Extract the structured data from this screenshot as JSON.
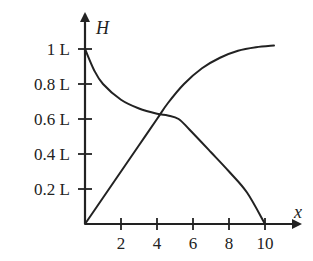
{
  "chart_data": {
    "type": "line",
    "title": "",
    "xlabel": "x",
    "ylabel": "H",
    "xlim": [
      0,
      11
    ],
    "ylim": [
      0,
      1.05
    ],
    "x_ticks": [
      2,
      4,
      6,
      8,
      10
    ],
    "y_ticks": [
      0.2,
      0.4,
      0.6,
      0.8,
      1.0
    ],
    "x_tick_labels": [
      "2",
      "4",
      "6",
      "8",
      "10"
    ],
    "y_tick_labels": [
      "0.2 L",
      "0.4 L",
      "0.6 L",
      "0.8 L",
      "1 L"
    ],
    "grid": false,
    "legend": null,
    "series": [
      {
        "name": "rising curve",
        "points": [
          [
            0,
            0
          ],
          [
            1,
            0.15
          ],
          [
            2,
            0.3
          ],
          [
            3,
            0.45
          ],
          [
            4,
            0.6
          ],
          [
            4.6,
            0.69
          ],
          [
            5.5,
            0.8
          ],
          [
            6.5,
            0.89
          ],
          [
            7.5,
            0.95
          ],
          [
            8.5,
            0.99
          ],
          [
            9.5,
            1.01
          ],
          [
            10.5,
            1.02
          ]
        ]
      },
      {
        "name": "falling curve",
        "points": [
          [
            0,
            1.0
          ],
          [
            0.5,
            0.88
          ],
          [
            1,
            0.8
          ],
          [
            2,
            0.71
          ],
          [
            3,
            0.66
          ],
          [
            4,
            0.63
          ],
          [
            4.6,
            0.62
          ],
          [
            5.2,
            0.6
          ],
          [
            5.8,
            0.54
          ],
          [
            7,
            0.41
          ],
          [
            8,
            0.3
          ],
          [
            9,
            0.18
          ],
          [
            10,
            0.0
          ]
        ]
      }
    ],
    "annotations": [
      "curves intersect near x≈4.3, H≈0.62 L"
    ]
  }
}
